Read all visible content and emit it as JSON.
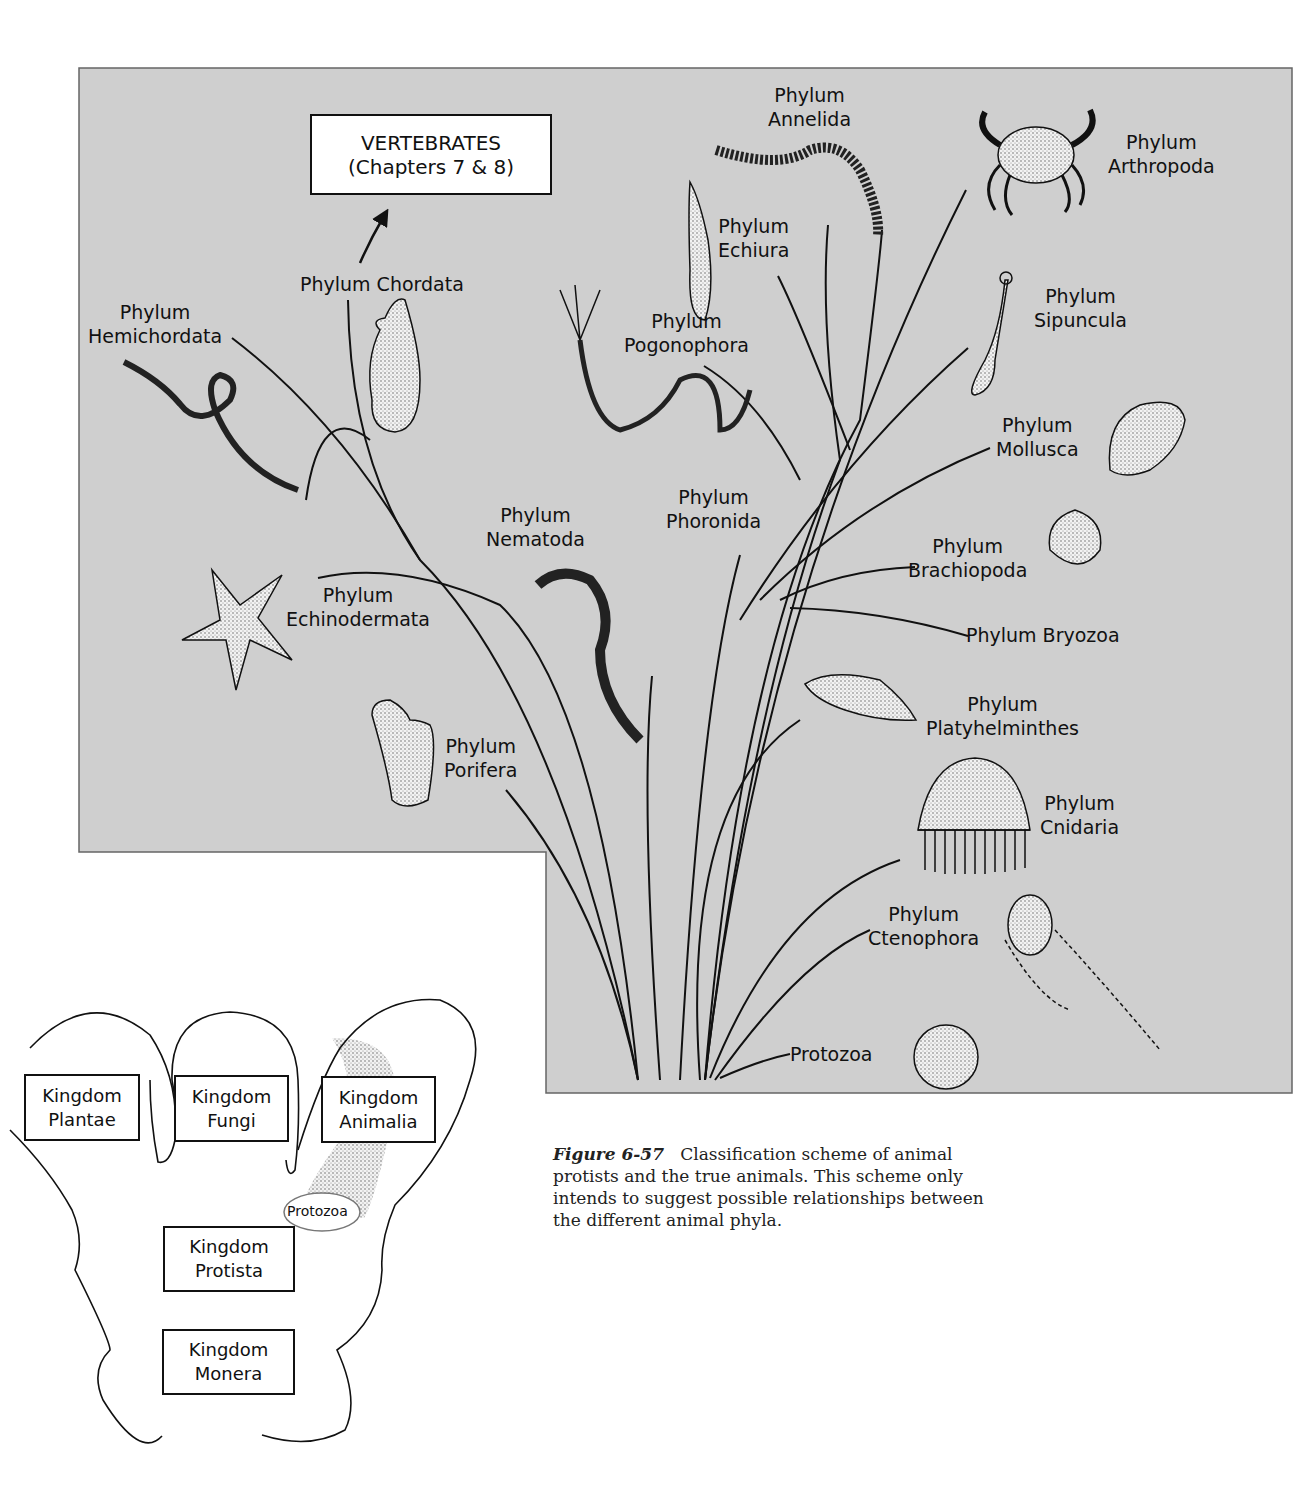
{
  "figure": {
    "number": "Figure 6-57",
    "caption": "Classification scheme of animal protists and the true animals. This scheme only intends to suggest possible relationships between the different animal phyla.",
    "colors": {
      "panel": "#cfcfcf",
      "ink": "#111111",
      "box": "#ffffff"
    }
  },
  "tree": {
    "vertebrates_box": {
      "line1": "VERTEBRATES",
      "line2": "(Chapters 7 & 8)"
    },
    "branches": [
      {
        "id": "chordata",
        "line1": "Phylum Chordata",
        "line2": ""
      },
      {
        "id": "hemichordata",
        "line1": "Phylum",
        "line2": "Hemichordata"
      },
      {
        "id": "annelida",
        "line1": "Phylum",
        "line2": "Annelida"
      },
      {
        "id": "arthropoda",
        "line1": "Phylum",
        "line2": "Arthropoda"
      },
      {
        "id": "echiura",
        "line1": "Phylum",
        "line2": "Echiura"
      },
      {
        "id": "pogonophora",
        "line1": "Phylum",
        "line2": "Pogonophora"
      },
      {
        "id": "sipuncula",
        "line1": "Phylum",
        "line2": "Sipuncula"
      },
      {
        "id": "mollusca",
        "line1": "Phylum",
        "line2": "Mollusca"
      },
      {
        "id": "nematoda",
        "line1": "Phylum",
        "line2": "Nematoda"
      },
      {
        "id": "phoronida",
        "line1": "Phylum",
        "line2": "Phoronida"
      },
      {
        "id": "brachiopoda",
        "line1": "Phylum",
        "line2": "Brachiopoda"
      },
      {
        "id": "echinodermata",
        "line1": "Phylum",
        "line2": "Echinodermata"
      },
      {
        "id": "bryozoa",
        "line1": "Phylum Bryozoa",
        "line2": ""
      },
      {
        "id": "platyhelminthes",
        "line1": "Phylum",
        "line2": "Platyhelminthes"
      },
      {
        "id": "porifera",
        "line1": "Phylum",
        "line2": "Porifera"
      },
      {
        "id": "cnidaria",
        "line1": "Phylum",
        "line2": "Cnidaria"
      },
      {
        "id": "ctenophora",
        "line1": "Phylum",
        "line2": "Ctenophora"
      },
      {
        "id": "protozoa",
        "line1": "Protozoa",
        "line2": ""
      }
    ]
  },
  "kingdoms": {
    "plantae": {
      "line1": "Kingdom",
      "line2": "Plantae"
    },
    "fungi": {
      "line1": "Kingdom",
      "line2": "Fungi"
    },
    "animalia": {
      "line1": "Kingdom",
      "line2": "Animalia"
    },
    "protista": {
      "line1": "Kingdom",
      "line2": "Protista"
    },
    "monera": {
      "line1": "Kingdom",
      "line2": "Monera"
    },
    "protozoa_oval": "Protozoa"
  }
}
